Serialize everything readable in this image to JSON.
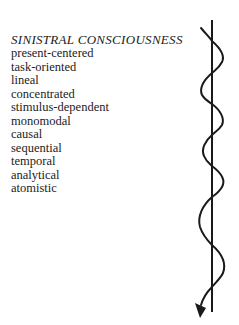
{
  "heading": "SINISTRAL CONSCIOUSNESS",
  "traits": [
    "present-centered",
    "task-oriented",
    "lineal",
    "concentrated",
    "stimulus-dependent",
    "monomodal",
    "causal",
    "sequential",
    "temporal",
    "analytical",
    "atomistic"
  ],
  "figure": {
    "stroke_color": "#1a1a1a",
    "axis_line": {
      "x": 212,
      "y_start": 20,
      "y_end": 312
    },
    "wave_path": "M201,28 C206,34 210,38 212,41 C220,48 225,56 222,62 C219,68 215,70 212,73 C204,80 199,88 202,95 C205,100 209,102 212,104 C220,110 225,118 222,125 C219,130 215,132 212,135 C205,141 201,149 204,156 C206,161 209,163 212,166 C220,172 226,180 222,187 C219,192 215,195 212,197 C203,205 197,216 200,227 C203,236 208,241 212,245 C220,252 227,262 223,273 C220,279 215,283 212,287 C207,292 203,298 201,305",
    "arrowhead": "195,303 206,308 200,318"
  }
}
